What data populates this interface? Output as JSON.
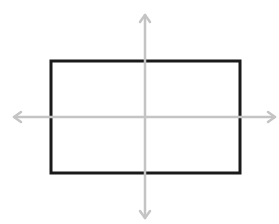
{
  "diagram": {
    "type": "rectangle-on-coordinate-axes",
    "background": "#ffffff",
    "rectangle": {
      "x": 51,
      "y": 61,
      "width": 189,
      "height": 112,
      "stroke": "#1a1a1a",
      "stroke_width": 3
    },
    "axes": {
      "color": "#c4c4c4",
      "stroke_width": 2.5,
      "horizontal": {
        "y": 117,
        "x1": 14,
        "x2": 275
      },
      "vertical": {
        "x": 145,
        "y1": 15,
        "y2": 218
      },
      "arrowheads": [
        "left",
        "right",
        "up",
        "down"
      ]
    }
  }
}
